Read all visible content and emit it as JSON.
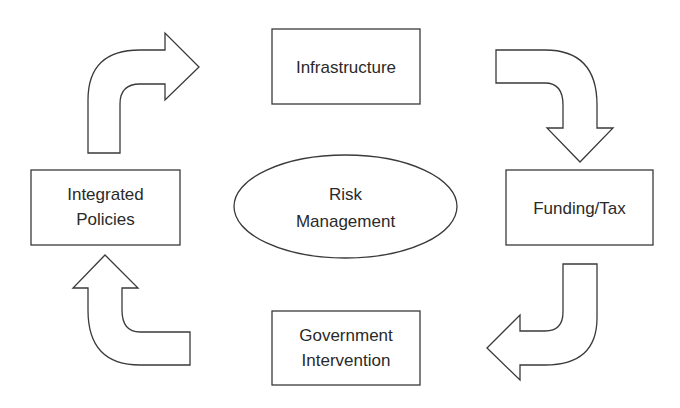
{
  "diagram": {
    "center": {
      "lines": [
        "Risk",
        "Management"
      ]
    },
    "nodes": [
      {
        "id": "infrastructure",
        "lines": [
          "Infrastructure"
        ]
      },
      {
        "id": "funding-tax",
        "lines": [
          "Funding/Tax"
        ]
      },
      {
        "id": "government-intervention",
        "lines": [
          "Government",
          "Intervention"
        ]
      },
      {
        "id": "integrated-policies",
        "lines": [
          "Integrated",
          "Policies"
        ]
      }
    ],
    "flow": [
      {
        "from": "integrated-policies",
        "to": "infrastructure",
        "direction": "up-then-right"
      },
      {
        "from": "infrastructure",
        "to": "funding-tax",
        "direction": "right-then-down"
      },
      {
        "from": "funding-tax",
        "to": "government-intervention",
        "direction": "down-then-left"
      },
      {
        "from": "government-intervention",
        "to": "integrated-policies",
        "direction": "left-then-up"
      }
    ],
    "colors": {
      "stroke": "#3a3a3a",
      "fill": "#ffffff",
      "text": "#2a2a2a"
    }
  }
}
